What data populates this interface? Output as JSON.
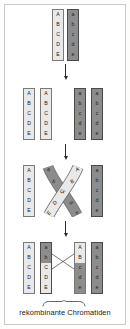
{
  "figure": {
    "caption": "rekombinante Chromatiden",
    "colors": {
      "light_chromatid": "#e9e9e9",
      "dark_chromatid": "#8c8c8c",
      "light_border": "#7a7a7a",
      "dark_border": "#4a4a4a",
      "arrow": "#2b2b2b",
      "frame": "#c9c9c9",
      "text": "#161616",
      "background": "#ffffff"
    }
  },
  "stages": [
    {
      "id": "stage-1-homologous-pair",
      "name": "Homologenpaar",
      "chromatids": [
        {
          "id": "s1-c1",
          "shade": "light",
          "segments": [
            {
              "label": "A",
              "shade": "light"
            },
            {
              "label": "B",
              "shade": "light"
            },
            {
              "label": "C",
              "shade": "light"
            },
            {
              "label": "D",
              "shade": "light"
            },
            {
              "label": "E",
              "shade": "light"
            }
          ]
        },
        {
          "id": "s1-c2",
          "shade": "dark",
          "segments": [
            {
              "label": "a",
              "shade": "dark"
            },
            {
              "label": "b",
              "shade": "dark"
            },
            {
              "label": "c",
              "shade": "dark"
            },
            {
              "label": "d",
              "shade": "dark"
            },
            {
              "label": "e",
              "shade": "dark"
            }
          ]
        }
      ]
    },
    {
      "id": "stage-2-replicated",
      "name": "Verdoppelte Chromatiden",
      "chromatids": [
        {
          "id": "s2-c1",
          "shade": "light",
          "segments": [
            {
              "label": "A",
              "shade": "light"
            },
            {
              "label": "B",
              "shade": "light"
            },
            {
              "label": "C",
              "shade": "light"
            },
            {
              "label": "D",
              "shade": "light"
            },
            {
              "label": "E",
              "shade": "light"
            }
          ]
        },
        {
          "id": "s2-c2",
          "shade": "light",
          "segments": [
            {
              "label": "A",
              "shade": "light"
            },
            {
              "label": "B",
              "shade": "light"
            },
            {
              "label": "C",
              "shade": "light"
            },
            {
              "label": "D",
              "shade": "light"
            },
            {
              "label": "E",
              "shade": "light"
            }
          ]
        },
        {
          "id": "s2-c3",
          "shade": "dark",
          "segments": [
            {
              "label": "a",
              "shade": "dark"
            },
            {
              "label": "b",
              "shade": "dark"
            },
            {
              "label": "c",
              "shade": "dark"
            },
            {
              "label": "d",
              "shade": "dark"
            },
            {
              "label": "e",
              "shade": "dark"
            }
          ]
        },
        {
          "id": "s2-c4",
          "shade": "dark",
          "segments": [
            {
              "label": "a",
              "shade": "dark"
            },
            {
              "label": "b",
              "shade": "dark"
            },
            {
              "label": "c",
              "shade": "dark"
            },
            {
              "label": "d",
              "shade": "dark"
            },
            {
              "label": "e",
              "shade": "dark"
            }
          ]
        }
      ]
    },
    {
      "id": "stage-3-crossing-over",
      "name": "Crossing-over",
      "outer_chromatids": [
        {
          "id": "s3-c1",
          "shade": "light",
          "segments": [
            {
              "label": "A",
              "shade": "light"
            },
            {
              "label": "B",
              "shade": "light"
            },
            {
              "label": "C",
              "shade": "light"
            },
            {
              "label": "D",
              "shade": "light"
            },
            {
              "label": "E",
              "shade": "light"
            }
          ]
        },
        {
          "id": "s3-c4",
          "shade": "dark",
          "segments": [
            {
              "label": "a",
              "shade": "dark"
            },
            {
              "label": "b",
              "shade": "dark"
            },
            {
              "label": "c",
              "shade": "dark"
            },
            {
              "label": "d",
              "shade": "dark"
            },
            {
              "label": "e",
              "shade": "dark"
            }
          ]
        }
      ],
      "crossed_strand_light": [
        "A",
        "B",
        "C",
        "D",
        "E"
      ],
      "crossed_strand_dark": [
        "a",
        "b",
        "c",
        "d",
        "e"
      ]
    },
    {
      "id": "stage-4-recombinant",
      "name": "Rekombinante Chromatiden",
      "chromatids": [
        {
          "id": "s4-c1",
          "shade": "light",
          "recombinant": false,
          "segments": [
            {
              "label": "A",
              "shade": "light"
            },
            {
              "label": "B",
              "shade": "light"
            },
            {
              "label": "C",
              "shade": "light"
            },
            {
              "label": "D",
              "shade": "light"
            },
            {
              "label": "E",
              "shade": "light"
            }
          ]
        },
        {
          "id": "s4-c2",
          "shade": "mixed",
          "recombinant": true,
          "segments": [
            {
              "label": "a",
              "shade": "dark"
            },
            {
              "label": "b",
              "shade": "dark"
            },
            {
              "label": "C",
              "shade": "light"
            },
            {
              "label": "D",
              "shade": "light"
            },
            {
              "label": "E",
              "shade": "light"
            }
          ]
        },
        {
          "id": "s4-c3",
          "shade": "mixed",
          "recombinant": true,
          "segments": [
            {
              "label": "A",
              "shade": "light"
            },
            {
              "label": "B",
              "shade": "light"
            },
            {
              "label": "c",
              "shade": "dark"
            },
            {
              "label": "d",
              "shade": "dark"
            },
            {
              "label": "e",
              "shade": "dark"
            }
          ]
        },
        {
          "id": "s4-c4",
          "shade": "dark",
          "recombinant": false,
          "segments": [
            {
              "label": "a",
              "shade": "dark"
            },
            {
              "label": "b",
              "shade": "dark"
            },
            {
              "label": "c",
              "shade": "dark"
            },
            {
              "label": "d",
              "shade": "dark"
            },
            {
              "label": "e",
              "shade": "dark"
            }
          ]
        }
      ]
    }
  ],
  "arrows": [
    {
      "id": "arrow-1",
      "from": "stage-1-homologous-pair",
      "to": "stage-2-replicated"
    },
    {
      "id": "arrow-2",
      "from": "stage-2-replicated",
      "to": "stage-3-crossing-over"
    },
    {
      "id": "arrow-3",
      "from": "stage-3-crossing-over",
      "to": "stage-4-recombinant"
    }
  ]
}
